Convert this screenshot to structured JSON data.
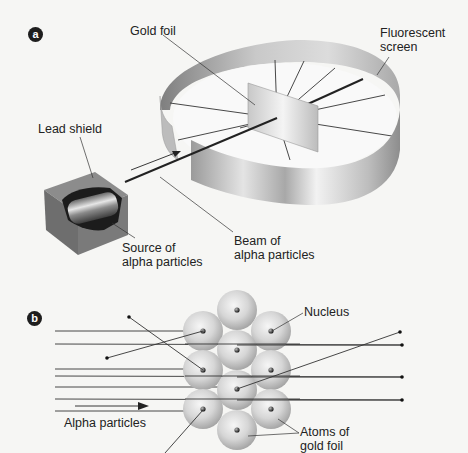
{
  "panel_a": {
    "badge": "a",
    "labels": {
      "gold_foil": "Gold foil",
      "fluorescent_screen": "Fluorescent\nscreen",
      "lead_shield": "Lead shield",
      "source": "Source of\nalpha particles",
      "beam": "Beam of\nalpha particles"
    }
  },
  "panel_b": {
    "badge": "b",
    "labels": {
      "nucleus": "Nucleus",
      "alpha_particles": "Alpha particles",
      "atoms": "Atoms of\ngold foil"
    }
  },
  "colors": {
    "background": "#f6f6f4",
    "text": "#222222",
    "line": "#333333",
    "ring_light": "#e8e8e8",
    "ring_dark": "#8a8a8a",
    "lead_box": "#7d7d7d",
    "badge": "#1e1e1e"
  }
}
